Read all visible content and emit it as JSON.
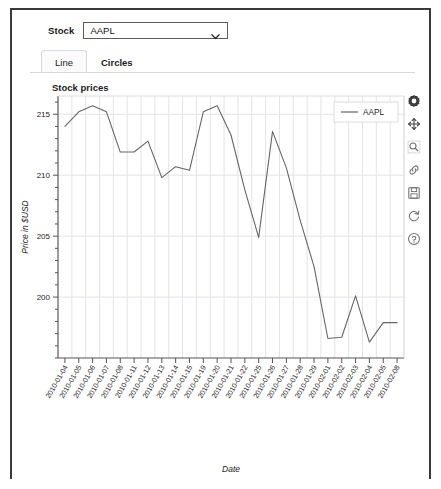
{
  "window": {
    "title": "Stock prices viewer"
  },
  "controls": {
    "stock_label": "Stock",
    "select": {
      "name": "stock-select",
      "value": "AAPL",
      "options": [
        "AAPL"
      ],
      "arrow_icon": "chevron-down-icon"
    }
  },
  "tabs": [
    {
      "label": "Line",
      "active": true
    },
    {
      "label": "Circles",
      "active": false
    }
  ],
  "toolbar": {
    "buttons": [
      {
        "icon": "gear-icon",
        "label": "Settings"
      },
      {
        "icon": "move-icon",
        "label": "Pan"
      },
      {
        "icon": "zoom-icon",
        "label": "Zoom"
      },
      {
        "icon": "link-icon",
        "label": "Link"
      },
      {
        "icon": "save-icon",
        "label": "Save"
      },
      {
        "icon": "reset-icon",
        "label": "Reset"
      },
      {
        "icon": "help-icon",
        "label": "Help"
      }
    ]
  },
  "chart_data": {
    "type": "line",
    "title": "Stock prices",
    "xlabel": "Date",
    "ylabel": "Price in $USD",
    "grid": true,
    "legend_position": "top-right",
    "ylim": [
      195.0,
      216.5
    ],
    "yticks": [
      200,
      205,
      210,
      215
    ],
    "ytick_labels": [
      "200",
      "205",
      "210",
      "215"
    ],
    "line_color": "#666666",
    "categories": [
      "2010-01-04",
      "2010-01-05",
      "2010-01-06",
      "2010-01-07",
      "2010-01-08",
      "2010-01-11",
      "2010-01-12",
      "2010-01-13",
      "2010-01-14",
      "2010-01-15",
      "2010-01-19",
      "2010-01-20",
      "2010-01-21",
      "2010-01-22",
      "2010-01-25",
      "2010-01-26",
      "2010-01-27",
      "2010-01-28",
      "2010-01-29",
      "2010-02-01",
      "2010-02-02",
      "2010-02-03",
      "2010-02-04",
      "2010-02-05",
      "2010-02-08"
    ],
    "series": [
      {
        "name": "AAPL",
        "values": [
          214.0,
          215.2,
          215.7,
          215.2,
          211.9,
          211.9,
          212.8,
          209.8,
          210.7,
          210.4,
          215.2,
          215.7,
          213.3,
          208.8,
          204.9,
          213.6,
          210.6,
          206.3,
          202.5,
          196.6,
          196.7,
          200.1,
          196.3,
          197.9,
          197.9
        ]
      }
    ],
    "legend": [
      {
        "label": "AAPL",
        "color": "#666666"
      }
    ]
  }
}
